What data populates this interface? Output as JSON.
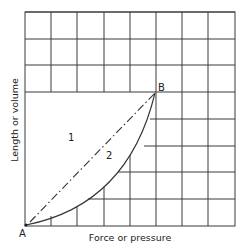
{
  "diagram": {
    "x_axis_label": "Force or pressure",
    "y_axis_label": "Length or volume",
    "point_start_label": "A",
    "point_end_label": "B",
    "region_1_label": "1",
    "region_2_label": "2",
    "grid": {
      "columns": 8,
      "rows": 8
    },
    "curves": [
      {
        "id": "1",
        "style": "dash-dot",
        "description": "straight line from A to B"
      },
      {
        "id": "2",
        "style": "solid",
        "description": "concave curve from A to B"
      }
    ],
    "colors": {
      "line": "#333333",
      "background": "#ffffff"
    }
  }
}
